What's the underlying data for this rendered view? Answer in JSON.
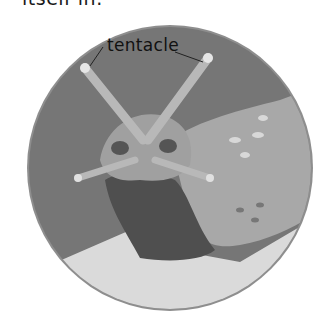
{
  "caption_fragment": "itself in.",
  "label": "tentacle",
  "colors": {
    "background_circle": "#7a7a7a",
    "circle_rim": "#8e8e8e",
    "slug_body": "#a9a9a9",
    "slug_foot": "#555555",
    "ground": "#dcdcdc",
    "tentacle_tip": "#e6e6e6"
  }
}
